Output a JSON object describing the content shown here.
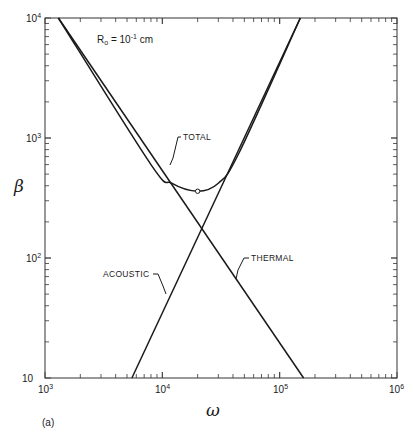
{
  "chart_data": {
    "type": "line",
    "title": "",
    "panel_label": "(a)",
    "annotation": {
      "text": "R",
      "subscript": "o",
      "rest": " = 10",
      "exponent": "-1",
      "unit": " cm"
    },
    "xlabel": "ω",
    "ylabel": "β",
    "xscale": "log",
    "yscale": "log",
    "xlim": [
      1000,
      1000000
    ],
    "ylim": [
      10,
      10000
    ],
    "x_ticks": [
      {
        "base": "10",
        "exp": "3"
      },
      {
        "base": "10",
        "exp": "4"
      },
      {
        "base": "10",
        "exp": "5"
      },
      {
        "base": "10",
        "exp": "6"
      }
    ],
    "y_ticks": [
      {
        "base": "10",
        "exp": ""
      },
      {
        "base": "10",
        "exp": "2"
      },
      {
        "base": "10",
        "exp": "3"
      },
      {
        "base": "10",
        "exp": "4"
      }
    ],
    "grid": false,
    "legend": "inline labels",
    "series": [
      {
        "name": "THERMAL",
        "points": [
          [
            1300,
            10000
          ],
          [
            15000,
            110
          ],
          [
            160000,
            10
          ]
        ]
      },
      {
        "name": "ACOUSTIC",
        "points": [
          [
            5500,
            10
          ],
          [
            21000,
            180
          ],
          [
            150000,
            10000
          ]
        ]
      },
      {
        "name": "TOTAL",
        "points": [
          [
            1300,
            10000
          ],
          [
            8000,
            600
          ],
          [
            12000,
            420
          ],
          [
            20000,
            360
          ],
          [
            30000,
            420
          ],
          [
            45000,
            750
          ],
          [
            150000,
            10000
          ]
        ],
        "minimum": [
          20000,
          360
        ]
      }
    ]
  }
}
